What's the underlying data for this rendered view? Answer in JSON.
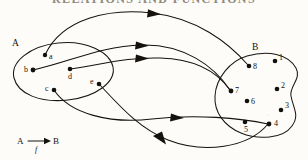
{
  "page": {
    "header_text": "RELATIONS AND FUNCTIONS",
    "background_color": "#fdfcf8",
    "ink_color": "#15120e",
    "width": 308,
    "height": 160
  },
  "diagram": {
    "type": "function-mapping",
    "sets": [
      {
        "key": "A",
        "label": "A",
        "label_x": 12,
        "label_y": 46,
        "shape": "ellipse",
        "elements": [
          {
            "label": "a",
            "x": 45,
            "y": 55,
            "label_dx": 4,
            "label_dy": 4
          },
          {
            "label": "b",
            "x": 33,
            "y": 70,
            "label_dx": -9,
            "label_dy": 2
          },
          {
            "label": "c",
            "x": 54,
            "y": 90,
            "label_dx": -9,
            "label_dy": 1
          },
          {
            "label": "d",
            "x": 70,
            "y": 69,
            "label_dx": -2,
            "label_dy": 10
          },
          {
            "label": "e",
            "x": 99,
            "y": 84,
            "label_dx": -9,
            "label_dy": 0
          }
        ]
      },
      {
        "key": "B",
        "label": "B",
        "label_x": 252,
        "label_y": 50,
        "shape": "blob",
        "elements": [
          {
            "label": "1",
            "x": 275,
            "y": 61,
            "label_dx": 4,
            "label_dy": -1
          },
          {
            "label": "2",
            "x": 277,
            "y": 89,
            "label_dx": 4,
            "label_dy": -1
          },
          {
            "label": "3",
            "x": 281,
            "y": 110,
            "label_dx": 4,
            "label_dy": -2
          },
          {
            "label": "4",
            "x": 269,
            "y": 124,
            "label_dx": 5,
            "label_dy": 2
          },
          {
            "label": "5",
            "x": 245,
            "y": 122,
            "label_dx": -1,
            "label_dy": 10
          },
          {
            "label": "6",
            "x": 247,
            "y": 101,
            "label_dx": 4,
            "label_dy": 3
          },
          {
            "label": "7",
            "x": 231,
            "y": 91,
            "label_dx": 4,
            "label_dy": 2
          },
          {
            "label": "8",
            "x": 249,
            "y": 66,
            "label_dx": 4,
            "label_dy": 3
          }
        ]
      }
    ],
    "mappings": [
      {
        "from": "a",
        "to": "8",
        "name": "arrow-a-to-8"
      },
      {
        "from": "b",
        "to": "7",
        "name": "arrow-b-to-7"
      },
      {
        "from": "d",
        "to": "7",
        "name": "arrow-d-to-7"
      },
      {
        "from": "c",
        "to": "4",
        "name": "arrow-c-to-4"
      },
      {
        "from": "e",
        "to": "4",
        "name": "arrow-e-to-4"
      }
    ]
  },
  "legend": {
    "domain_label": "A",
    "codomain_label": "B",
    "function_label": "f"
  }
}
